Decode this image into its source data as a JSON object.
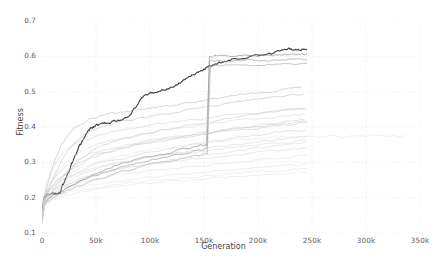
{
  "chart_data": {
    "type": "line",
    "title": "",
    "xlabel": "Generation",
    "ylabel": "Fitness",
    "xlim": [
      0,
      350000
    ],
    "ylim": [
      0.1,
      0.7
    ],
    "xticks": [
      0,
      50000,
      100000,
      150000,
      200000,
      250000,
      300000,
      350000
    ],
    "xtick_labels": [
      "0",
      "50k",
      "100k",
      "150k",
      "200k",
      "250k",
      "300k",
      "350k"
    ],
    "yticks": [
      0.1,
      0.2,
      0.3,
      0.4,
      0.5,
      0.6,
      0.7
    ],
    "ytick_labels": [
      "0.1",
      "0.2",
      "0.3",
      "0.4",
      "0.5",
      "0.6",
      "0.7"
    ],
    "grid": true,
    "grid_style": "dotted",
    "grid_color": "#e8e8e8",
    "background_color": "#ffffff",
    "legend": "none",
    "note": "Many overlapping evolutionary runs; one highlighted dark run plus ~20 faint gray runs.",
    "series": [
      {
        "name": "highlighted-run",
        "color": "#3c3c3c",
        "width": 1.1,
        "opacity": 1.0,
        "x": [
          0,
          1500,
          3000,
          5000,
          8000,
          11000,
          14000,
          17000,
          18500,
          20000,
          22000,
          25000,
          28000,
          31000,
          34000,
          37000,
          40000,
          43000,
          46000,
          50000,
          55000,
          60000,
          65000,
          70000,
          76000,
          82000,
          88000,
          94000,
          100000,
          106000,
          112000,
          118000,
          124000,
          130000,
          136000,
          142000,
          148000,
          152000,
          158000,
          165000,
          172000,
          180000,
          190000,
          200000,
          210000,
          220000,
          228000,
          234000,
          240000,
          245000
        ],
        "y": [
          0.14,
          0.196,
          0.205,
          0.209,
          0.21,
          0.211,
          0.212,
          0.213,
          0.236,
          0.239,
          0.255,
          0.276,
          0.3,
          0.322,
          0.341,
          0.358,
          0.374,
          0.388,
          0.398,
          0.404,
          0.409,
          0.412,
          0.415,
          0.419,
          0.425,
          0.436,
          0.463,
          0.487,
          0.495,
          0.499,
          0.503,
          0.509,
          0.519,
          0.53,
          0.543,
          0.552,
          0.56,
          0.566,
          0.575,
          0.582,
          0.588,
          0.594,
          0.599,
          0.603,
          0.607,
          0.615,
          0.621,
          0.618,
          0.62,
          0.621
        ]
      },
      {
        "name": "jump-bundle-top",
        "color": "#8d8d8d",
        "width": 0.8,
        "opacity": 0.85,
        "x": [
          0,
          2000,
          5000,
          10000,
          20000,
          35000,
          50000,
          70000,
          90000,
          110000,
          130000,
          148000,
          153000,
          155000,
          160000,
          175000,
          190000,
          205000,
          220000,
          235000,
          245000
        ],
        "y": [
          0.135,
          0.18,
          0.196,
          0.205,
          0.222,
          0.248,
          0.268,
          0.292,
          0.308,
          0.322,
          0.336,
          0.346,
          0.35,
          0.598,
          0.6,
          0.601,
          0.602,
          0.603,
          0.604,
          0.605,
          0.606
        ]
      },
      {
        "name": "jump-bundle-mid",
        "color": "#9a9a9a",
        "width": 0.8,
        "opacity": 0.8,
        "x": [
          0,
          2000,
          6000,
          14000,
          28000,
          46000,
          68000,
          92000,
          116000,
          140000,
          152000,
          155000,
          165000,
          185000,
          205000,
          225000,
          245000
        ],
        "y": [
          0.138,
          0.184,
          0.199,
          0.214,
          0.236,
          0.258,
          0.281,
          0.3,
          0.316,
          0.332,
          0.34,
          0.584,
          0.586,
          0.588,
          0.59,
          0.592,
          0.593
        ]
      },
      {
        "name": "jump-bundle-low",
        "color": "#a5a5a5",
        "width": 0.8,
        "opacity": 0.78,
        "x": [
          0,
          2500,
          7000,
          16000,
          32000,
          52000,
          74000,
          98000,
          122000,
          144000,
          153000,
          156000,
          170000,
          195000,
          220000,
          245000
        ],
        "y": [
          0.133,
          0.178,
          0.194,
          0.21,
          0.23,
          0.25,
          0.272,
          0.291,
          0.307,
          0.32,
          0.327,
          0.572,
          0.574,
          0.576,
          0.578,
          0.58
        ]
      },
      {
        "name": "run-04",
        "color": "#b0b0b0",
        "width": 0.7,
        "opacity": 0.75,
        "x": [
          0,
          2000,
          5000,
          10000,
          18000,
          30000,
          45000,
          62000,
          80000,
          100000,
          120000,
          140000,
          160000,
          180000,
          200000,
          220000,
          240000
        ],
        "y": [
          0.14,
          0.2,
          0.235,
          0.29,
          0.35,
          0.398,
          0.424,
          0.436,
          0.444,
          0.452,
          0.46,
          0.47,
          0.48,
          0.49,
          0.498,
          0.505,
          0.51
        ]
      },
      {
        "name": "run-05",
        "color": "#b6b6b6",
        "width": 0.7,
        "opacity": 0.72,
        "x": [
          0,
          2000,
          6000,
          13000,
          24000,
          40000,
          58000,
          78000,
          100000,
          124000,
          148000,
          172000,
          196000,
          220000,
          242000
        ],
        "y": [
          0.136,
          0.192,
          0.224,
          0.276,
          0.336,
          0.382,
          0.404,
          0.418,
          0.43,
          0.442,
          0.455,
          0.468,
          0.478,
          0.486,
          0.492
        ]
      },
      {
        "name": "run-06",
        "color": "#bdbdbd",
        "width": 0.7,
        "opacity": 0.7,
        "x": [
          0,
          3000,
          8000,
          18000,
          32000,
          50000,
          72000,
          96000,
          120000,
          146000,
          172000,
          198000,
          222000,
          244000
        ],
        "y": [
          0.132,
          0.186,
          0.212,
          0.252,
          0.3,
          0.34,
          0.366,
          0.382,
          0.396,
          0.41,
          0.424,
          0.436,
          0.446,
          0.452
        ]
      },
      {
        "name": "run-07",
        "color": "#c2c2c2",
        "width": 0.7,
        "opacity": 0.7,
        "x": [
          0,
          2500,
          7000,
          15000,
          28000,
          46000,
          68000,
          92000,
          118000,
          144000,
          170000,
          196000,
          220000,
          243000
        ],
        "y": [
          0.142,
          0.198,
          0.222,
          0.25,
          0.282,
          0.312,
          0.334,
          0.35,
          0.364,
          0.378,
          0.392,
          0.404,
          0.414,
          0.42
        ]
      },
      {
        "name": "run-08",
        "color": "#c6c6c6",
        "width": 0.7,
        "opacity": 0.68,
        "x": [
          0,
          2000,
          6000,
          14000,
          26000,
          44000,
          66000,
          90000,
          116000,
          142000,
          168000,
          194000,
          220000,
          244000
        ],
        "y": [
          0.134,
          0.188,
          0.208,
          0.232,
          0.258,
          0.286,
          0.306,
          0.322,
          0.336,
          0.35,
          0.364,
          0.376,
          0.386,
          0.393
        ]
      },
      {
        "name": "run-09",
        "color": "#cacaca",
        "width": 0.7,
        "opacity": 0.68,
        "x": [
          0,
          2500,
          8000,
          18000,
          34000,
          54000,
          76000,
          100000,
          126000,
          152000,
          178000,
          204000,
          228000,
          245000
        ],
        "y": [
          0.138,
          0.194,
          0.214,
          0.238,
          0.262,
          0.284,
          0.3,
          0.314,
          0.326,
          0.338,
          0.35,
          0.36,
          0.368,
          0.373
        ]
      },
      {
        "name": "run-10",
        "color": "#cecece",
        "width": 0.7,
        "opacity": 0.66,
        "x": [
          0,
          2000,
          7000,
          16000,
          30000,
          50000,
          72000,
          98000,
          124000,
          150000,
          176000,
          202000,
          226000,
          245000
        ],
        "y": [
          0.13,
          0.182,
          0.202,
          0.224,
          0.246,
          0.266,
          0.282,
          0.296,
          0.308,
          0.32,
          0.331,
          0.341,
          0.349,
          0.355
        ]
      },
      {
        "name": "run-11",
        "color": "#d2d2d2",
        "width": 0.7,
        "opacity": 0.66,
        "x": [
          0,
          3000,
          9000,
          20000,
          36000,
          56000,
          80000,
          106000,
          132000,
          158000,
          184000,
          210000,
          232000,
          245000
        ],
        "y": [
          0.14,
          0.196,
          0.216,
          0.236,
          0.254,
          0.27,
          0.284,
          0.295,
          0.305,
          0.314,
          0.322,
          0.33,
          0.336,
          0.339
        ]
      },
      {
        "name": "run-12",
        "color": "#d5d5d5",
        "width": 0.7,
        "opacity": 0.64,
        "x": [
          0,
          2000,
          6000,
          15000,
          28000,
          48000,
          70000,
          96000,
          122000,
          148000,
          174000,
          200000,
          224000,
          245000
        ],
        "y": [
          0.136,
          0.19,
          0.206,
          0.222,
          0.238,
          0.252,
          0.264,
          0.274,
          0.283,
          0.291,
          0.299,
          0.306,
          0.312,
          0.317
        ]
      },
      {
        "name": "run-13",
        "color": "#d8d8d8",
        "width": 0.7,
        "opacity": 0.62,
        "x": [
          0,
          2500,
          8000,
          18000,
          33000,
          53000,
          78000,
          104000,
          130000,
          156000,
          182000,
          208000,
          230000,
          245000
        ],
        "y": [
          0.132,
          0.184,
          0.2,
          0.214,
          0.228,
          0.24,
          0.25,
          0.259,
          0.267,
          0.274,
          0.281,
          0.287,
          0.292,
          0.295
        ]
      },
      {
        "name": "run-14",
        "color": "#dbdbdb",
        "width": 0.7,
        "opacity": 0.62,
        "x": [
          0,
          2000,
          7000,
          17000,
          32000,
          52000,
          76000,
          102000,
          128000,
          154000,
          180000,
          206000,
          230000,
          245000
        ],
        "y": [
          0.128,
          0.178,
          0.194,
          0.208,
          0.22,
          0.231,
          0.24,
          0.248,
          0.255,
          0.262,
          0.268,
          0.274,
          0.279,
          0.282
        ]
      },
      {
        "name": "run-15-long-tail",
        "color": "#dedede",
        "width": 0.7,
        "opacity": 0.7,
        "x": [
          0,
          2000,
          6000,
          14000,
          28000,
          48000,
          72000,
          100000,
          130000,
          160000,
          190000,
          215000,
          240000,
          265000,
          285000,
          305000,
          320000,
          335000
        ],
        "y": [
          0.138,
          0.192,
          0.212,
          0.24,
          0.272,
          0.3,
          0.32,
          0.336,
          0.348,
          0.358,
          0.366,
          0.37,
          0.373,
          0.374,
          0.372,
          0.374,
          0.373,
          0.372
        ]
      },
      {
        "name": "run-16",
        "color": "#d0d0d0",
        "width": 0.7,
        "opacity": 0.66,
        "x": [
          0,
          2000,
          5000,
          12000,
          22000,
          38000,
          58000,
          82000,
          108000,
          136000,
          164000,
          192000,
          220000,
          244000
        ],
        "y": [
          0.145,
          0.205,
          0.228,
          0.262,
          0.3,
          0.336,
          0.358,
          0.374,
          0.388,
          0.4,
          0.412,
          0.422,
          0.43,
          0.436
        ]
      },
      {
        "name": "run-17",
        "color": "#c8c8c8",
        "width": 0.7,
        "opacity": 0.68,
        "x": [
          0,
          1800,
          4500,
          10000,
          20000,
          34000,
          54000,
          78000,
          104000,
          132000,
          160000,
          188000,
          216000,
          243000
        ],
        "y": [
          0.143,
          0.208,
          0.244,
          0.288,
          0.33,
          0.36,
          0.38,
          0.394,
          0.406,
          0.417,
          0.428,
          0.438,
          0.446,
          0.452
        ]
      },
      {
        "name": "run-18",
        "color": "#bfbfbf",
        "width": 0.7,
        "opacity": 0.7,
        "x": [
          0,
          2200,
          6500,
          15000,
          28000,
          46000,
          68000,
          94000,
          120000,
          148000,
          176000,
          204000,
          230000,
          245000
        ],
        "y": [
          0.134,
          0.19,
          0.218,
          0.254,
          0.29,
          0.318,
          0.338,
          0.354,
          0.366,
          0.378,
          0.39,
          0.4,
          0.408,
          0.413
        ]
      },
      {
        "name": "run-19",
        "color": "#dadada",
        "width": 0.7,
        "opacity": 0.6,
        "x": [
          0,
          2000,
          8000,
          20000,
          38000,
          60000,
          86000,
          114000,
          142000,
          170000,
          198000,
          224000,
          245000
        ],
        "y": [
          0.13,
          0.176,
          0.192,
          0.206,
          0.218,
          0.228,
          0.237,
          0.245,
          0.252,
          0.258,
          0.264,
          0.269,
          0.272
        ]
      },
      {
        "name": "run-20",
        "color": "#cdcdcd",
        "width": 0.7,
        "opacity": 0.64,
        "x": [
          0,
          2000,
          6000,
          16000,
          30000,
          52000,
          78000,
          106000,
          134000,
          162000,
          190000,
          218000,
          244000
        ],
        "y": [
          0.141,
          0.2,
          0.222,
          0.246,
          0.268,
          0.288,
          0.304,
          0.316,
          0.327,
          0.337,
          0.346,
          0.354,
          0.361
        ]
      },
      {
        "name": "run-21",
        "color": "#c4c4c4",
        "width": 0.7,
        "opacity": 0.66,
        "x": [
          0,
          2000,
          5500,
          13000,
          25000,
          42000,
          64000,
          90000,
          118000,
          146000,
          174000,
          202000,
          228000,
          245000
        ],
        "y": [
          0.137,
          0.196,
          0.226,
          0.262,
          0.296,
          0.322,
          0.342,
          0.357,
          0.37,
          0.382,
          0.393,
          0.403,
          0.411,
          0.416
        ]
      }
    ]
  },
  "axes": {
    "xlabel": "Generation",
    "ylabel": "Fitness"
  }
}
